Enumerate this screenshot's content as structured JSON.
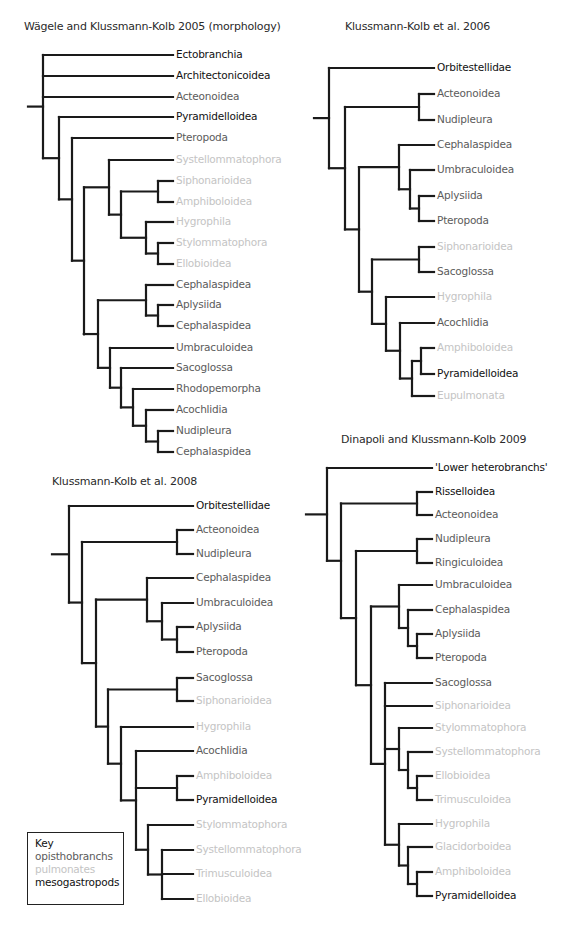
{
  "colors": {
    "opisthobranchs": "#5b5b5b",
    "pulmonates": "#c4c4c4",
    "mesogastropods": "#111111",
    "branch": "#1a1a1a",
    "title": "#2a2a2a"
  },
  "key": {
    "title": "Key",
    "items": [
      {
        "label": "opisthobranchs",
        "group": "opisthobranchs"
      },
      {
        "label": "pulmonates",
        "group": "pulmonates"
      },
      {
        "label": "mesogastropods",
        "group": "mesogastropods"
      }
    ]
  },
  "chart_data": [
    {
      "type": "tree",
      "title": "Wägele and Klussmann-Kolb 2005 (morphology)",
      "title_pos": [
        24,
        27
      ],
      "label_x": 176,
      "root_stub": [
        28,
        43
      ],
      "leaves": [
        {
          "label": "Ectobranchia",
          "y": 55,
          "group": "mesogastropods"
        },
        {
          "label": "Architectonicoidea",
          "y": 76,
          "group": "mesogastropods"
        },
        {
          "label": "Acteonoidea",
          "y": 97,
          "group": "opisthobranchs"
        },
        {
          "label": "Pyramidelloidea",
          "y": 117,
          "group": "mesogastropods"
        },
        {
          "label": "Pteropoda",
          "y": 138,
          "group": "opisthobranchs"
        },
        {
          "label": "Systellommatophora",
          "y": 160,
          "group": "pulmonates"
        },
        {
          "label": "Siphonarioidea",
          "y": 181,
          "group": "pulmonates"
        },
        {
          "label": "Amphiboloidea",
          "y": 202,
          "group": "pulmonates"
        },
        {
          "label": "Hygrophila",
          "y": 222,
          "group": "pulmonates"
        },
        {
          "label": "Stylommatophora",
          "y": 243,
          "group": "pulmonates"
        },
        {
          "label": "Ellobioidea",
          "y": 264,
          "group": "pulmonates"
        },
        {
          "label": "Cephalaspidea",
          "y": 285,
          "group": "opisthobranchs"
        },
        {
          "label": "Aplysiida",
          "y": 305,
          "group": "opisthobranchs"
        },
        {
          "label": "Cephalaspidea",
          "y": 326,
          "group": "opisthobranchs"
        },
        {
          "label": "Umbraculoidea",
          "y": 348,
          "group": "opisthobranchs"
        },
        {
          "label": "Sacoglossa",
          "y": 368,
          "group": "opisthobranchs"
        },
        {
          "label": "Rhodopemorpha",
          "y": 389,
          "group": "opisthobranchs"
        },
        {
          "label": "Acochlidia",
          "y": 410,
          "group": "opisthobranchs"
        },
        {
          "label": "Nudipleura",
          "y": 431,
          "group": "opisthobranchs"
        },
        {
          "label": "Cephalaspidea",
          "y": 452,
          "group": "opisthobranchs"
        }
      ],
      "newick": "(0,1,2,(3,(4,((5,((6,7),(8,(9,10)))),(((11,(12,13)),(14,(15,(16,(17,(18,19)))))))))))",
      "node_x": {
        "(0,1,2,(3,(4,((5,((6,7),(8,(9,10)))),(((11,(12,13)),(14,(15,(16,(17,(18,19)))))))))))": 43,
        "(3,(4,((5,((6,7),(8,(9,10)))),(((11,(12,13)),(14,(15,(16,(17,(18,19))))))))))": 59,
        "(4,((5,((6,7),(8,(9,10)))),(((11,(12,13)),(14,(15,(16,(17,(18,19)))))))))": 72,
        "((5,((6,7),(8,(9,10)))),(((11,(12,13)),(14,(15,(16,(17,(18,19))))))))": 84,
        "(5,((6,7),(8,(9,10))))": 109,
        "((6,7),(8,(9,10)))": 121,
        "(6,7)": 158,
        "(8,(9,10))": 146,
        "(9,10)": 158,
        "(((11,(12,13)),(14,(15,(16,(17,(18,19)))))))": 84,
        "((11,(12,13)),(14,(15,(16,(17,(18,19))))))": 98,
        "(11,(12,13))": 146,
        "(12,13)": 158,
        "(14,(15,(16,(17,(18,19)))))": 110,
        "(15,(16,(17,(18,19))))": 121,
        "(16,(17,(18,19)))": 133,
        "(17,(18,19))": 146,
        "(18,19)": 158
      }
    },
    {
      "type": "tree",
      "title": "Klussmann-Kolb et al. 2006",
      "title_pos": [
        345,
        27
      ],
      "label_x": 437,
      "root_stub": [
        314,
        329
      ],
      "leaves": [
        {
          "label": "Orbitestellidae",
          "y": 68,
          "group": "mesogastropods"
        },
        {
          "label": "Acteonoidea",
          "y": 94,
          "group": "opisthobranchs"
        },
        {
          "label": "Nudipleura",
          "y": 120,
          "group": "opisthobranchs"
        },
        {
          "label": "Cephalaspidea",
          "y": 145,
          "group": "opisthobranchs"
        },
        {
          "label": "Umbraculoidea",
          "y": 170,
          "group": "opisthobranchs"
        },
        {
          "label": "Aplysiida",
          "y": 196,
          "group": "opisthobranchs"
        },
        {
          "label": "Pteropoda",
          "y": 221,
          "group": "opisthobranchs"
        },
        {
          "label": "Siphonarioidea",
          "y": 247,
          "group": "pulmonates"
        },
        {
          "label": "Sacoglossa",
          "y": 272,
          "group": "opisthobranchs"
        },
        {
          "label": "Hygrophila",
          "y": 297,
          "group": "pulmonates"
        },
        {
          "label": "Acochlidia",
          "y": 323,
          "group": "opisthobranchs"
        },
        {
          "label": "Amphiboloidea",
          "y": 348,
          "group": "pulmonates"
        },
        {
          "label": "Pyramidelloidea",
          "y": 374,
          "group": "mesogastropods"
        },
        {
          "label": "Eupulmonata",
          "y": 396,
          "group": "pulmonates"
        }
      ],
      "newick": "(0,((1,2),((3,(4,(5,6))),((7,8),(9,(10,((11,12),13)))))))",
      "node_x": {
        "(0,((1,2),((3,(4,(5,6))),((7,8),(9,(10,((11,12),13)))))))": 329,
        "((1,2),((3,(4,(5,6))),((7,8),(9,(10,((11,12),13))))))": 345,
        "(1,2)": 419,
        "((3,(4,(5,6))),((7,8),(9,(10,((11,12),13)))))": 359,
        "(3,(4,(5,6)))": 399,
        "(4,(5,6))": 410,
        "(5,6)": 419,
        "((7,8),(9,(10,((11,12),13))))": 372,
        "(7,8)": 419,
        "(9,(10,((11,12),13)))": 386,
        "(10,((11,12),13))": 400,
        "((11,12),13)": 412,
        "(11,12)": 421
      }
    },
    {
      "type": "tree",
      "title": "Klussmann-Kolb et al. 2008",
      "title_pos": [
        52,
        482
      ],
      "label_x": 196,
      "root_stub": [
        52,
        68
      ],
      "leaves": [
        {
          "label": "Orbitestellidae",
          "y": 506,
          "group": "mesogastropods"
        },
        {
          "label": "Acteonoidea",
          "y": 530,
          "group": "opisthobranchs"
        },
        {
          "label": "Nudipleura",
          "y": 554,
          "group": "opisthobranchs"
        },
        {
          "label": "Cephalaspidea",
          "y": 578,
          "group": "opisthobranchs"
        },
        {
          "label": "Umbraculoidea",
          "y": 603,
          "group": "opisthobranchs"
        },
        {
          "label": "Aplysiida",
          "y": 627,
          "group": "opisthobranchs"
        },
        {
          "label": "Pteropoda",
          "y": 652,
          "group": "opisthobranchs"
        },
        {
          "label": "Sacoglossa",
          "y": 678,
          "group": "opisthobranchs"
        },
        {
          "label": "Siphonarioidea",
          "y": 701,
          "group": "pulmonates"
        },
        {
          "label": "Hygrophila",
          "y": 727,
          "group": "pulmonates"
        },
        {
          "label": "Acochlidia",
          "y": 751,
          "group": "opisthobranchs"
        },
        {
          "label": "Amphiboloidea",
          "y": 776,
          "group": "pulmonates"
        },
        {
          "label": "Pyramidelloidea",
          "y": 800,
          "group": "mesogastropods"
        },
        {
          "label": "Stylommatophora",
          "y": 825,
          "group": "pulmonates"
        },
        {
          "label": "Systellommatophora",
          "y": 850,
          "group": "pulmonates"
        },
        {
          "label": "Trimusculoidea",
          "y": 874,
          "group": "pulmonates"
        },
        {
          "label": "Ellobioidea",
          "y": 899,
          "group": "pulmonates"
        }
      ],
      "newick": "(0,((1,2),((3,(4,(5,6))),((7,8),(9,(10,(11,12),(13,(14,15,16))))))))",
      "node_x": {
        "(0,((1,2),((3,(4,(5,6))),((7,8),(9,(10,(11,12),(13,(14,15,16))))))))": 69,
        "((1,2),((3,(4,(5,6))),((7,8),(9,(10,(11,12),(13,(14,15,16)))))))": 82,
        "(1,2)": 177,
        "((3,(4,(5,6))),((7,8),(9,(10,(11,12),(13,(14,15,16))))))": 96,
        "(3,(4,(5,6)))": 147,
        "(4,(5,6))": 162,
        "(5,6)": 177,
        "((7,8),(9,(10,(11,12),(13,(14,15,16)))))": 108,
        "(7,8)": 177,
        "(9,(10,(11,12),(13,(14,15,16))))": 121,
        "(10,(11,12),(13,(14,15,16)))": 136,
        "(11,12)": 177,
        "(13,(14,15,16))": 148,
        "(14,15,16)": 162
      }
    },
    {
      "type": "tree",
      "title": "Dinapoli and Klussmann-Kolb 2009",
      "title_pos": [
        341,
        440
      ],
      "label_x": 435,
      "root_stub": [
        306,
        327
      ],
      "leaves": [
        {
          "label": "'Lower heterobranchs'",
          "y": 468,
          "group": "mesogastropods"
        },
        {
          "label": "Risselloidea",
          "y": 492,
          "group": "mesogastropods"
        },
        {
          "label": "Acteonoidea",
          "y": 515,
          "group": "opisthobranchs"
        },
        {
          "label": "Nudipleura",
          "y": 539,
          "group": "opisthobranchs"
        },
        {
          "label": "Ringiculoidea",
          "y": 563,
          "group": "opisthobranchs"
        },
        {
          "label": "Umbraculoidea",
          "y": 585,
          "group": "opisthobranchs"
        },
        {
          "label": "Cephalaspidea",
          "y": 610,
          "group": "opisthobranchs"
        },
        {
          "label": "Aplysiida",
          "y": 634,
          "group": "opisthobranchs"
        },
        {
          "label": "Pteropoda",
          "y": 658,
          "group": "opisthobranchs"
        },
        {
          "label": "Sacoglossa",
          "y": 683,
          "group": "opisthobranchs"
        },
        {
          "label": "Siphonarioidea",
          "y": 706,
          "group": "pulmonates"
        },
        {
          "label": "Stylommatophora",
          "y": 728,
          "group": "pulmonates"
        },
        {
          "label": "Systellommatophora",
          "y": 752,
          "group": "pulmonates"
        },
        {
          "label": "Ellobioidea",
          "y": 776,
          "group": "pulmonates"
        },
        {
          "label": "Trimusculoidea",
          "y": 800,
          "group": "pulmonates"
        },
        {
          "label": "Hygrophila",
          "y": 824,
          "group": "pulmonates"
        },
        {
          "label": "Glacidorboidea",
          "y": 847,
          "group": "pulmonates"
        },
        {
          "label": "Amphiboloidea",
          "y": 872,
          "group": "pulmonates"
        },
        {
          "label": "Pyramidelloidea",
          "y": 896,
          "group": "mesogastropods"
        }
      ],
      "newick": "(0,((1,2),((3,4),((5,(6,(7,8))),(9,10,(11,(12,(13,14))),(15,(16,(17,18))))))))",
      "node_x": {
        "(0,((1,2),((3,4),((5,(6,(7,8))),(9,10,(11,(12,(13,14))),(15,(16,(17,18))))))))": 327,
        "((1,2),((3,4),((5,(6,(7,8))),(9,10,(11,(12,(13,14))),(15,(16,(17,18)))))))": 341,
        "(1,2)": 417,
        "((3,4),((5,(6,(7,8))),(9,10,(11,(12,(13,14))),(15,(16,(17,18))))))": 356,
        "(3,4)": 417,
        "((5,(6,(7,8))),(9,10,(11,(12,(13,14))),(15,(16,(17,18)))))": 371,
        "(5,(6,(7,8)))": 399,
        "(6,(7,8))": 408,
        "(7,8)": 417,
        "(9,10,(11,(12,(13,14))),(15,(16,(17,18))))": 385,
        "(11,(12,(13,14)))": 399,
        "(12,(13,14))": 408,
        "(13,14)": 417,
        "(15,(16,(17,18)))": 399,
        "(16,(17,18))": 408,
        "(17,18)": 417
      }
    }
  ]
}
